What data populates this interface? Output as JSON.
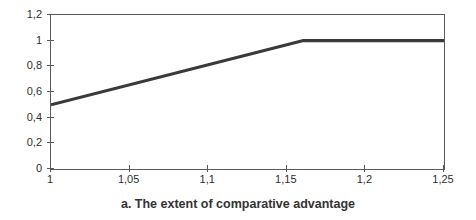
{
  "chart_data": {
    "type": "line",
    "caption": "a. The extent of comparative advantage",
    "xlabel": "",
    "ylabel": "",
    "xlim": [
      1,
      1.25
    ],
    "ylim": [
      0,
      1.2
    ],
    "x_tick_labels": [
      "1",
      "1,05",
      "1,1",
      "1,15",
      "1,2",
      "1,25"
    ],
    "x_tick_values": [
      1,
      1.05,
      1.1,
      1.15,
      1.2,
      1.25
    ],
    "y_tick_labels": [
      "0",
      "0,2",
      "0,4",
      "0,6",
      "0,8",
      "1",
      "1,2"
    ],
    "y_tick_values": [
      0,
      0.2,
      0.4,
      0.6,
      0.8,
      1,
      1.2
    ],
    "decimal_separator": ",",
    "grid": false,
    "legend": "none",
    "series": [
      {
        "name": "extent-of-comparative-advantage",
        "points": [
          [
            1,
            0.5
          ],
          [
            1.16,
            1.0
          ],
          [
            1.25,
            1.0
          ]
        ]
      }
    ],
    "colors": {
      "line": "#3a3a3a",
      "frame": "#5a5a5a",
      "text": "#2f2f2f",
      "background": "#ffffff"
    }
  }
}
